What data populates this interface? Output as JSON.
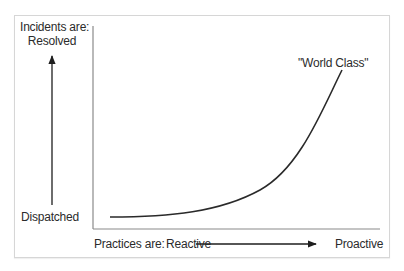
{
  "diagram": {
    "y_axis": {
      "title_line1": "Incidents are:",
      "title_line2": "Resolved",
      "low_label": "Dispatched",
      "direction": "up"
    },
    "x_axis": {
      "title": "Practices are:",
      "low_label": "Reactive",
      "high_label": "Proactive",
      "direction": "right"
    },
    "curve": {
      "shape": "exponential-growth",
      "annotation": "\"World Class\""
    },
    "colors": {
      "line": "#2a2a2a",
      "axis": "#8a8a8a",
      "frame": "#d6d6d6",
      "background": "#ffffff"
    }
  }
}
